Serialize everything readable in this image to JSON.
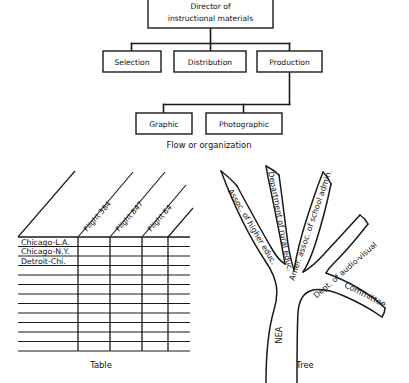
{
  "figure": {
    "background_color": "#ffffff",
    "ink_color": "#1a1a1a"
  },
  "flowchart": {
    "caption": "Flow or organization",
    "root": {
      "line1": "Director of",
      "line2": "instructional materials"
    },
    "level2": [
      {
        "label": "Selection"
      },
      {
        "label": "Distribution"
      },
      {
        "label": "Production"
      }
    ],
    "level3": [
      {
        "label": "Graphic"
      },
      {
        "label": "Photographic"
      }
    ]
  },
  "table": {
    "caption": "Table",
    "column_headers": [
      "Flight 384",
      "Flight 847",
      "Flight 64"
    ],
    "row_labels": [
      "Chicago-L.A.",
      "Chicago-N.Y.",
      "Detroit-Chi.",
      "",
      "",
      "",
      "",
      "",
      "",
      "",
      "",
      ""
    ],
    "cell_values": [
      [
        "",
        "",
        ""
      ],
      [
        "",
        "",
        ""
      ],
      [
        "",
        "",
        ""
      ],
      [
        "",
        "",
        ""
      ],
      [
        "",
        "",
        ""
      ],
      [
        "",
        "",
        ""
      ],
      [
        "",
        "",
        ""
      ],
      [
        "",
        "",
        ""
      ],
      [
        "",
        "",
        ""
      ],
      [
        "",
        "",
        ""
      ],
      [
        "",
        "",
        ""
      ],
      [
        "",
        "",
        ""
      ]
    ]
  },
  "tree": {
    "caption": "Tree",
    "trunk_label": "NEA",
    "branches": [
      {
        "label": "Assoc. of higher educ."
      },
      {
        "label": "Department of rural educ."
      },
      {
        "label": "Amer. assoc. of school admin."
      },
      {
        "label": "Dept. of audio-visual"
      },
      {
        "label": "Committee"
      }
    ]
  }
}
